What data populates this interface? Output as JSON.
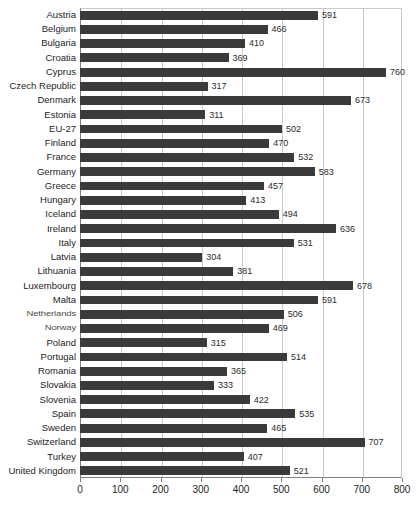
{
  "chart_data": {
    "type": "bar",
    "orientation": "horizontal",
    "title": "",
    "xlabel": "",
    "ylabel": "",
    "xlim": [
      0,
      800
    ],
    "xticks": [
      0,
      100,
      200,
      300,
      400,
      500,
      600,
      700,
      800
    ],
    "grid": true,
    "legend": false,
    "bar_color": "#3a3a3a",
    "gridline_color": "#c9c9c9",
    "axis_color": "#808080",
    "show_value_labels": true,
    "categories": [
      "Austria",
      "Belgium",
      "Bulgaria",
      "Croatia",
      "Cyprus",
      "Czech Republic",
      "Denmark",
      "Estonia",
      "EU-27",
      "Finland",
      "France",
      "Germany",
      "Greece",
      "Hungary",
      "Iceland",
      "Ireland",
      "Italy",
      "Latvia",
      "Lithuania",
      "Luxembourg",
      "Malta",
      "Netherlands",
      "Norway",
      "Poland",
      "Portugal",
      "Romania",
      "Slovakia",
      "Slovenia",
      "Spain",
      "Sweden",
      "Switzerland",
      "Turkey",
      "United Kingdom"
    ],
    "values": [
      591,
      466,
      410,
      369,
      760,
      317,
      673,
      311,
      502,
      470,
      532,
      583,
      457,
      413,
      494,
      636,
      531,
      304,
      381,
      678,
      591,
      506,
      469,
      315,
      514,
      365,
      333,
      422,
      535,
      465,
      707,
      407,
      521
    ],
    "value_labels": [
      "591",
      "466",
      "410",
      "369",
      "760",
      "317",
      "673",
      "311",
      "502",
      "470",
      "532",
      "583",
      "457",
      "413",
      "494",
      "636",
      "531",
      "304",
      "381",
      "678",
      "591",
      "506",
      "469",
      "315",
      "514",
      "365",
      "333",
      "422",
      "535",
      "465",
      "707",
      "407",
      "521"
    ],
    "tick_labels": [
      "0",
      "100",
      "200",
      "300",
      "400",
      "500",
      "600",
      "700",
      "800"
    ]
  }
}
